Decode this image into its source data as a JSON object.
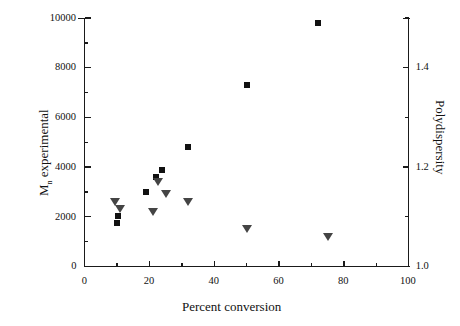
{
  "chart_data": {
    "type": "scatter",
    "title": "",
    "xlabel": "Percent conversion",
    "ylabel": "M n experimental",
    "y2label": "Polydispersity",
    "xlim": [
      0,
      100
    ],
    "ylim": [
      0,
      10000
    ],
    "y2lim": [
      1.0,
      1.5
    ],
    "xticks": [
      0,
      20,
      40,
      60,
      80,
      100
    ],
    "xticklabels": [
      "0",
      "20",
      "40",
      "60",
      "80",
      "100"
    ],
    "yticks": [
      0,
      2000,
      4000,
      6000,
      8000,
      10000
    ],
    "yticklabels": [
      "0",
      "2000",
      "4000",
      "6000",
      "8000",
      "10000"
    ],
    "y2ticks": [
      1.0,
      1.2,
      1.4
    ],
    "y2ticklabels": [
      "1.0",
      "1.2",
      "1.4"
    ],
    "minor_ticks": true,
    "grid": false,
    "legend": "none",
    "series": [
      {
        "name": "M n experimental",
        "marker": "filled-square",
        "color": "#111111",
        "axis": "left",
        "points": [
          {
            "x": 10.0,
            "y": 1750
          },
          {
            "x": 10.2,
            "y": 2050
          },
          {
            "x": 19.0,
            "y": 3000
          },
          {
            "x": 22.0,
            "y": 3600
          },
          {
            "x": 24.0,
            "y": 3900
          },
          {
            "x": 32.0,
            "y": 4800
          },
          {
            "x": 50.0,
            "y": 7300
          },
          {
            "x": 72.0,
            "y": 9800
          }
        ]
      },
      {
        "name": "Polydispersity",
        "marker": "filled-down-triangle",
        "color": "#444444",
        "axis": "right",
        "points": [
          {
            "x": 9.5,
            "y": 1.13
          },
          {
            "x": 11.0,
            "y": 1.115
          },
          {
            "x": 21.0,
            "y": 1.11
          },
          {
            "x": 22.5,
            "y": 1.17
          },
          {
            "x": 25.0,
            "y": 1.145
          },
          {
            "x": 32.0,
            "y": 1.13
          },
          {
            "x": 50.0,
            "y": 1.075
          },
          {
            "x": 75.0,
            "y": 1.06
          }
        ]
      }
    ]
  },
  "axes": {
    "x_title": "Percent conversion",
    "y_left_title_main": "M",
    "y_left_title_sub": "n",
    "y_left_title_rest": " experimental",
    "y_right_title": "Polydispersity"
  }
}
